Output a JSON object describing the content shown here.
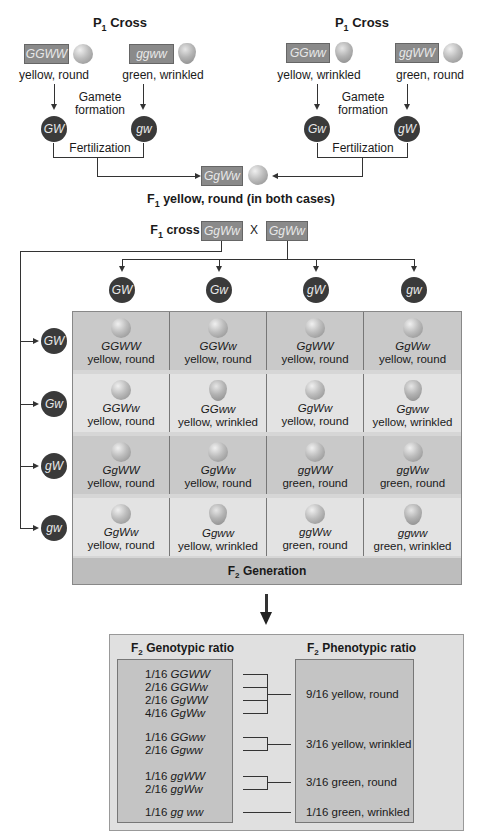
{
  "p1_left": {
    "title": "P",
    "title_sub": "1",
    "title_rest": " Cross",
    "parent1": {
      "genotype": "GGWW",
      "phenotype": "yellow, round",
      "pea": "round"
    },
    "parent2": {
      "genotype": "ggww",
      "phenotype": "green, wrinkled",
      "pea": "wrinkled"
    },
    "gamete_formation": "Gamete formation",
    "gamete1": "GW",
    "gamete2": "gw",
    "fertilization": "Fertilization"
  },
  "p1_right": {
    "title": "P",
    "title_sub": "1",
    "title_rest": " Cross",
    "parent1": {
      "genotype": "GGww",
      "phenotype": "yellow, wrinkled",
      "pea": "wrinkled"
    },
    "parent2": {
      "genotype": "ggWW",
      "phenotype": "green, round",
      "pea": "round"
    },
    "gamete_formation": "Gamete formation",
    "gamete1": "Gw",
    "gamete2": "gW",
    "fertilization": "Fertilization"
  },
  "f1": {
    "genotype": "GgWw",
    "label_prefix": "F",
    "label_sub": "1",
    "label_rest": " yellow, round (in both cases)"
  },
  "f1_cross": {
    "label_prefix": "F",
    "label_sub": "1",
    "label_rest": " cross",
    "parent1": "GgWw",
    "times": "X",
    "parent2": "GgWw"
  },
  "punnett": {
    "column_gametes": [
      "GW",
      "Gw",
      "gW",
      "gw"
    ],
    "row_gametes": [
      "GW",
      "Gw",
      "gW",
      "gw"
    ],
    "cells": [
      [
        {
          "genotype": "GGWW",
          "phenotype": "yellow, round",
          "pea": "round"
        },
        {
          "genotype": "GGWw",
          "phenotype": "yellow, round",
          "pea": "round"
        },
        {
          "genotype": "GgWW",
          "phenotype": "yellow, round",
          "pea": "round"
        },
        {
          "genotype": "GgWw",
          "phenotype": "yellow, round",
          "pea": "round"
        }
      ],
      [
        {
          "genotype": "GGWw",
          "phenotype": "yellow, round",
          "pea": "round"
        },
        {
          "genotype": "GGww",
          "phenotype": "yellow, wrinkled",
          "pea": "wrinkled"
        },
        {
          "genotype": "GgWw",
          "phenotype": "yellow, round",
          "pea": "round"
        },
        {
          "genotype": "Ggww",
          "phenotype": "yellow, wrinkled",
          "pea": "wrinkled"
        }
      ],
      [
        {
          "genotype": "GgWW",
          "phenotype": "yellow, round",
          "pea": "round"
        },
        {
          "genotype": "GgWw",
          "phenotype": "yellow, round",
          "pea": "round"
        },
        {
          "genotype": "ggWW",
          "phenotype": "green, round",
          "pea": "round"
        },
        {
          "genotype": "ggWw",
          "phenotype": "green, round",
          "pea": "round"
        }
      ],
      [
        {
          "genotype": "GgWw",
          "phenotype": "yellow, round",
          "pea": "round"
        },
        {
          "genotype": "Ggww",
          "phenotype": "yellow, wrinkled",
          "pea": "wrinkled"
        },
        {
          "genotype": "ggWw",
          "phenotype": "green, round",
          "pea": "round"
        },
        {
          "genotype": "ggww",
          "phenotype": "green, wrinkled",
          "pea": "wrinkled"
        }
      ]
    ],
    "footer_prefix": "F",
    "footer_sub": "2",
    "footer_rest": " Generation"
  },
  "ratios": {
    "genotypic_title_prefix": "F",
    "genotypic_title_sub": "2",
    "genotypic_title_rest": " Genotypic ratio",
    "phenotypic_title_prefix": "F",
    "phenotypic_title_sub": "2",
    "phenotypic_title_rest": " Phenotypic ratio",
    "genotypic": [
      {
        "fraction": "1/16",
        "genotype": "GGWW"
      },
      {
        "fraction": "2/16",
        "genotype": "GGWw"
      },
      {
        "fraction": "2/16",
        "genotype": "GgWW"
      },
      {
        "fraction": "4/16",
        "genotype": "GgWw"
      },
      {
        "fraction": "1/16",
        "genotype": "GGww"
      },
      {
        "fraction": "2/16",
        "genotype": "Ggww"
      },
      {
        "fraction": "1/16",
        "genotype": "ggWW"
      },
      {
        "fraction": "2/16",
        "genotype": "ggWw"
      },
      {
        "fraction": "1/16",
        "genotype": "gg ww"
      }
    ],
    "phenotypic": [
      "9/16 yellow, round",
      "3/16 yellow, wrinkled",
      "3/16 green, round",
      "1/16 green, wrinkled"
    ]
  },
  "colors": {
    "genotype_box": "#8a8a8a",
    "gamete_circle": "#3a3a3a",
    "grid_dark_row": "#c9c9c9",
    "grid_light_row": "#e3e3e3",
    "ratio_panel": "#e0e0e0",
    "ratio_box": "#c4c4c4"
  }
}
